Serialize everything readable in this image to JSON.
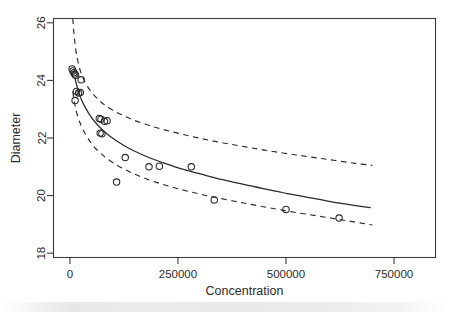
{
  "chart_data": {
    "type": "scatter",
    "title": "",
    "xlabel": "Concentration",
    "ylabel": "Diameter",
    "xlim": [
      -38000,
      846000
    ],
    "ylim": [
      17.85,
      26.15
    ],
    "xticks": [
      0,
      250000,
      500000,
      750000
    ],
    "xtick_labels": [
      "0",
      "250000",
      "500000",
      "750000"
    ],
    "yticks": [
      18,
      20,
      22,
      24,
      26
    ],
    "ytick_labels": [
      "18",
      "20",
      "22",
      "24",
      "26"
    ],
    "grid": false,
    "legend": null,
    "box": true,
    "points": [
      {
        "x": 5000,
        "y": 24.4
      },
      {
        "x": 7000,
        "y": 24.33
      },
      {
        "x": 9000,
        "y": 24.27
      },
      {
        "x": 11000,
        "y": 24.22
      },
      {
        "x": 13000,
        "y": 24.18
      },
      {
        "x": 26000,
        "y": 24.02
      },
      {
        "x": 15000,
        "y": 23.62
      },
      {
        "x": 20000,
        "y": 23.56
      },
      {
        "x": 24000,
        "y": 23.58
      },
      {
        "x": 12000,
        "y": 23.3
      },
      {
        "x": 68000,
        "y": 22.68
      },
      {
        "x": 72000,
        "y": 22.65
      },
      {
        "x": 80000,
        "y": 22.58
      },
      {
        "x": 86000,
        "y": 22.6
      },
      {
        "x": 70000,
        "y": 22.17
      },
      {
        "x": 74000,
        "y": 22.15
      },
      {
        "x": 128000,
        "y": 21.32
      },
      {
        "x": 108000,
        "y": 20.47
      },
      {
        "x": 183000,
        "y": 21.0
      },
      {
        "x": 207000,
        "y": 21.02
      },
      {
        "x": 281000,
        "y": 21.0
      },
      {
        "x": 334000,
        "y": 19.85
      },
      {
        "x": 500000,
        "y": 19.52
      },
      {
        "x": 623000,
        "y": 19.22
      }
    ],
    "fit_curve": {
      "style": "solid",
      "points": [
        {
          "x": 12000,
          "y": 24.05
        },
        {
          "x": 20000,
          "y": 23.6
        },
        {
          "x": 30000,
          "y": 23.22
        },
        {
          "x": 45000,
          "y": 22.82
        },
        {
          "x": 60000,
          "y": 22.52
        },
        {
          "x": 80000,
          "y": 22.22
        },
        {
          "x": 100000,
          "y": 21.98
        },
        {
          "x": 125000,
          "y": 21.74
        },
        {
          "x": 150000,
          "y": 21.54
        },
        {
          "x": 180000,
          "y": 21.34
        },
        {
          "x": 220000,
          "y": 21.12
        },
        {
          "x": 260000,
          "y": 20.92
        },
        {
          "x": 300000,
          "y": 20.76
        },
        {
          "x": 350000,
          "y": 20.56
        },
        {
          "x": 400000,
          "y": 20.4
        },
        {
          "x": 450000,
          "y": 20.23
        },
        {
          "x": 500000,
          "y": 20.08
        },
        {
          "x": 550000,
          "y": 19.94
        },
        {
          "x": 600000,
          "y": 19.8
        },
        {
          "x": 650000,
          "y": 19.68
        },
        {
          "x": 695000,
          "y": 19.58
        }
      ]
    },
    "upper_band": {
      "style": "dashed",
      "points": [
        {
          "x": 6500,
          "y": 26.15
        },
        {
          "x": 9000,
          "y": 25.7
        },
        {
          "x": 12000,
          "y": 25.25
        },
        {
          "x": 16000,
          "y": 24.85
        },
        {
          "x": 22000,
          "y": 24.44
        },
        {
          "x": 30000,
          "y": 24.1
        },
        {
          "x": 42000,
          "y": 23.76
        },
        {
          "x": 60000,
          "y": 23.42
        },
        {
          "x": 80000,
          "y": 23.15
        },
        {
          "x": 105000,
          "y": 22.92
        },
        {
          "x": 135000,
          "y": 22.7
        },
        {
          "x": 170000,
          "y": 22.5
        },
        {
          "x": 210000,
          "y": 22.32
        },
        {
          "x": 260000,
          "y": 22.13
        },
        {
          "x": 320000,
          "y": 21.93
        },
        {
          "x": 385000,
          "y": 21.75
        },
        {
          "x": 450000,
          "y": 21.58
        },
        {
          "x": 520000,
          "y": 21.42
        },
        {
          "x": 590000,
          "y": 21.27
        },
        {
          "x": 660000,
          "y": 21.12
        },
        {
          "x": 700000,
          "y": 21.05
        }
      ]
    },
    "lower_band": {
      "style": "dashed",
      "points": [
        {
          "x": 6500,
          "y": 23.62
        },
        {
          "x": 9000,
          "y": 23.36
        },
        {
          "x": 12000,
          "y": 23.12
        },
        {
          "x": 16000,
          "y": 22.86
        },
        {
          "x": 22000,
          "y": 22.58
        },
        {
          "x": 30000,
          "y": 22.3
        },
        {
          "x": 42000,
          "y": 21.98
        },
        {
          "x": 58000,
          "y": 21.66
        },
        {
          "x": 78000,
          "y": 21.38
        },
        {
          "x": 100000,
          "y": 21.14
        },
        {
          "x": 128000,
          "y": 20.9
        },
        {
          "x": 160000,
          "y": 20.68
        },
        {
          "x": 200000,
          "y": 20.46
        },
        {
          "x": 250000,
          "y": 20.24
        },
        {
          "x": 310000,
          "y": 20.02
        },
        {
          "x": 375000,
          "y": 19.82
        },
        {
          "x": 445000,
          "y": 19.62
        },
        {
          "x": 520000,
          "y": 19.42
        },
        {
          "x": 595000,
          "y": 19.24
        },
        {
          "x": 660000,
          "y": 19.08
        },
        {
          "x": 700000,
          "y": 18.98
        }
      ]
    },
    "colors": {
      "axis": "#3c3c3c",
      "point_stroke": "#2a2a2a",
      "fit_line": "#2a2a2a",
      "band_line": "#2a2a2a",
      "background": "#ffffff"
    }
  }
}
